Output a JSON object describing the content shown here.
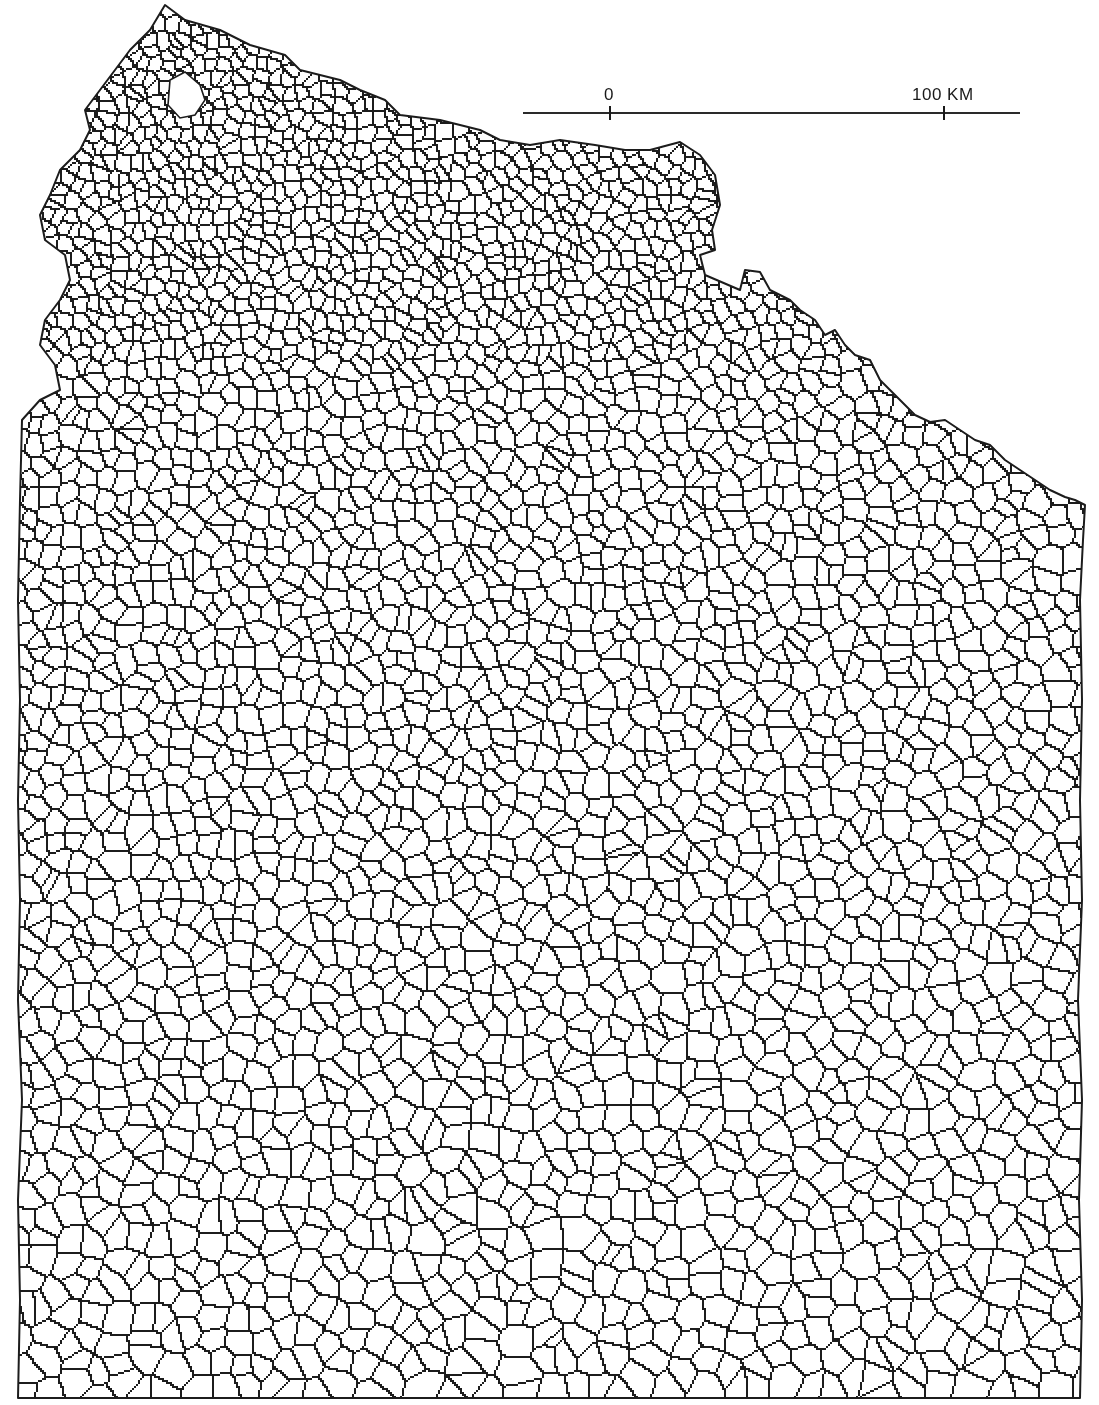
{
  "map": {
    "title": "",
    "description": "Administrative boundary map (commune mesh) of a northern coastal region",
    "stroke_color": "#1c1c1c",
    "background_color": "#ffffff",
    "outline": [
      [
        165,
        5
      ],
      [
        185,
        20
      ],
      [
        220,
        30
      ],
      [
        250,
        45
      ],
      [
        285,
        55
      ],
      [
        300,
        70
      ],
      [
        340,
        80
      ],
      [
        360,
        90
      ],
      [
        385,
        100
      ],
      [
        400,
        115
      ],
      [
        440,
        120
      ],
      [
        480,
        130
      ],
      [
        500,
        140
      ],
      [
        530,
        145
      ],
      [
        560,
        140
      ],
      [
        595,
        145
      ],
      [
        625,
        150
      ],
      [
        650,
        150
      ],
      [
        680,
        142
      ],
      [
        700,
        155
      ],
      [
        715,
        175
      ],
      [
        720,
        205
      ],
      [
        712,
        230
      ],
      [
        715,
        250
      ],
      [
        700,
        255
      ],
      [
        705,
        275
      ],
      [
        740,
        290
      ],
      [
        745,
        270
      ],
      [
        760,
        272
      ],
      [
        770,
        290
      ],
      [
        790,
        300
      ],
      [
        800,
        310
      ],
      [
        815,
        320
      ],
      [
        825,
        335
      ],
      [
        835,
        330
      ],
      [
        845,
        345
      ],
      [
        855,
        355
      ],
      [
        870,
        360
      ],
      [
        880,
        380
      ],
      [
        900,
        400
      ],
      [
        915,
        415
      ],
      [
        930,
        422
      ],
      [
        945,
        420
      ],
      [
        960,
        430
      ],
      [
        975,
        440
      ],
      [
        990,
        445
      ],
      [
        1005,
        460
      ],
      [
        1020,
        470
      ],
      [
        1035,
        480
      ],
      [
        1050,
        490
      ],
      [
        1065,
        497
      ],
      [
        1075,
        500
      ],
      [
        1085,
        505
      ],
      [
        1083,
        540
      ],
      [
        1080,
        600
      ],
      [
        1082,
        700
      ],
      [
        1080,
        800
      ],
      [
        1082,
        900
      ],
      [
        1078,
        1000
      ],
      [
        1082,
        1100
      ],
      [
        1079,
        1200
      ],
      [
        1082,
        1300
      ],
      [
        1080,
        1398
      ],
      [
        18,
        1398
      ],
      [
        20,
        1300
      ],
      [
        18,
        1200
      ],
      [
        22,
        1100
      ],
      [
        18,
        1000
      ],
      [
        20,
        900
      ],
      [
        18,
        800
      ],
      [
        20,
        700
      ],
      [
        18,
        600
      ],
      [
        20,
        500
      ],
      [
        22,
        420
      ],
      [
        40,
        400
      ],
      [
        60,
        390
      ],
      [
        55,
        365
      ],
      [
        40,
        345
      ],
      [
        45,
        320
      ],
      [
        60,
        300
      ],
      [
        70,
        280
      ],
      [
        65,
        255
      ],
      [
        45,
        240
      ],
      [
        40,
        215
      ],
      [
        50,
        195
      ],
      [
        60,
        170
      ],
      [
        80,
        150
      ],
      [
        90,
        130
      ],
      [
        85,
        110
      ],
      [
        100,
        90
      ],
      [
        115,
        70
      ],
      [
        130,
        50
      ],
      [
        150,
        30
      ]
    ],
    "lake": [
      [
        170,
        80
      ],
      [
        185,
        72
      ],
      [
        200,
        85
      ],
      [
        205,
        100
      ],
      [
        195,
        115
      ],
      [
        180,
        118
      ],
      [
        168,
        105
      ]
    ]
  },
  "scale_bar": {
    "zero_label": "0",
    "end_label": "100 KM",
    "line_x_start": 523,
    "line_x_end": 1020,
    "line_y": 113,
    "zero_tick_x": 610,
    "end_tick_x": 944
  }
}
